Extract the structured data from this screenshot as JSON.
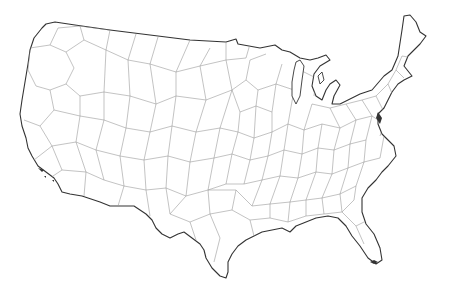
{
  "map": {
    "title": "",
    "subject": "Contiguous United States partitioned into Voronoi cells",
    "colors": {
      "background": "#ffffff",
      "cell_border": "#9a9a9a",
      "coastline": "#333333"
    },
    "labels": [],
    "legend": null
  }
}
